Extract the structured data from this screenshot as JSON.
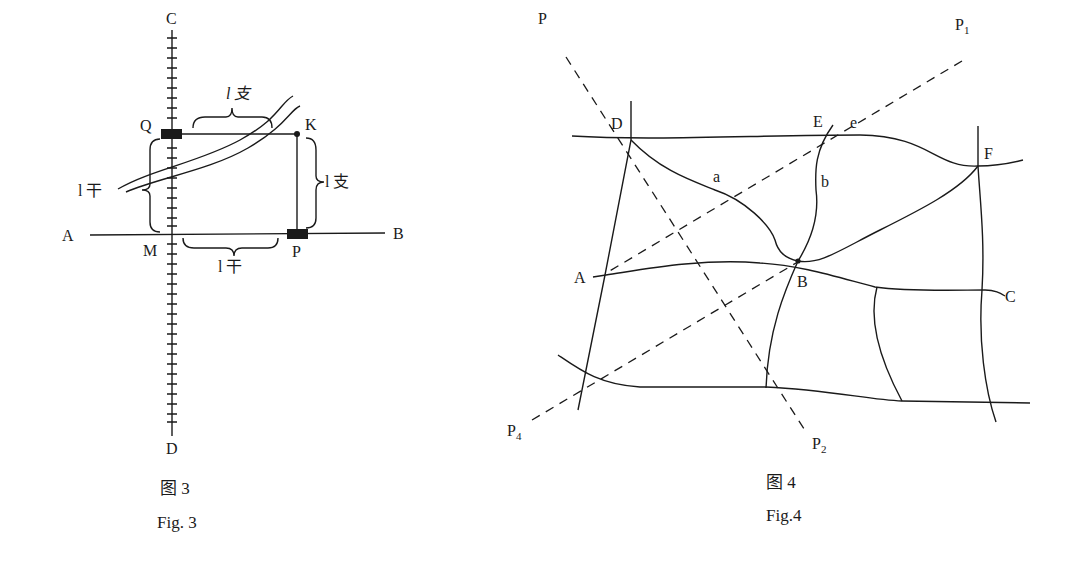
{
  "figure3": {
    "labels": {
      "C": "C",
      "D": "D",
      "A": "A",
      "B": "B",
      "M": "M",
      "Q": "Q",
      "K": "K",
      "P": "P",
      "l_branch_top": "l 支",
      "l_branch_right": "l 支",
      "l_trunk_left": "l 干",
      "l_trunk_bottom": "l 干"
    },
    "caption_cn": "图 3",
    "caption_en": "Fig. 3"
  },
  "figure4": {
    "labels": {
      "P": "P",
      "P1": "P",
      "P1_sub": "1",
      "P2": "P",
      "P2_sub": "2",
      "P4": "P",
      "P4_sub": "4",
      "D": "D",
      "E": "E",
      "e": "e",
      "F": "F",
      "a": "a",
      "b": "b",
      "A": "A",
      "B": "B",
      "C": "C"
    },
    "caption_cn": "图 4",
    "caption_en": "Fig.4"
  },
  "colors": {
    "ink": "#1a1a1a",
    "background": "#ffffff"
  }
}
